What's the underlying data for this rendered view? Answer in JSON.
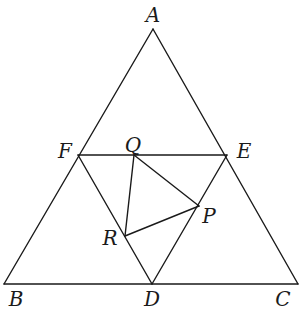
{
  "diagram": {
    "title": "",
    "points": {
      "A": {
        "label": "A",
        "x": 153,
        "y": 29,
        "lx": 153,
        "ly": 22
      },
      "B": {
        "label": "B",
        "x": 4,
        "y": 284,
        "lx": 16,
        "ly": 306
      },
      "C": {
        "label": "C",
        "x": 298,
        "y": 284,
        "lx": 283,
        "ly": 306
      },
      "D": {
        "label": "D",
        "x": 152,
        "y": 284,
        "lx": 152,
        "ly": 306
      },
      "E": {
        "label": "E",
        "x": 227,
        "y": 155,
        "lx": 244,
        "ly": 158
      },
      "F": {
        "label": "F",
        "x": 78,
        "y": 155,
        "lx": 65,
        "ly": 158
      },
      "P": {
        "label": "P",
        "x": 199,
        "y": 206,
        "lx": 209,
        "ly": 223
      },
      "Q": {
        "label": "Q",
        "x": 134,
        "y": 155,
        "lx": 133,
        "ly": 152
      },
      "R": {
        "label": "R",
        "x": 125,
        "y": 236,
        "lx": 110,
        "ly": 245
      }
    },
    "segments": [
      [
        "A",
        "B"
      ],
      [
        "B",
        "C"
      ],
      [
        "C",
        "A"
      ],
      [
        "F",
        "E"
      ],
      [
        "F",
        "D"
      ],
      [
        "E",
        "D"
      ],
      [
        "Q",
        "P"
      ],
      [
        "P",
        "R"
      ],
      [
        "R",
        "Q"
      ]
    ]
  }
}
